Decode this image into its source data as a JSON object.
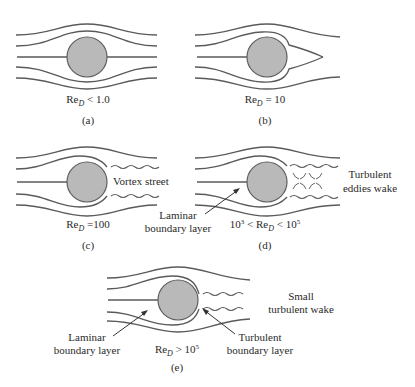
{
  "figure": {
    "panels": [
      {
        "id": "a",
        "caption": "(a)",
        "condition": {
          "prefix": "",
          "re": "Re",
          "sub": "D",
          "rel": " < 1.0",
          "suffix_sup": ""
        },
        "condition_text": "Re_D < 1.0",
        "flow": "symmetric laminar, no separation"
      },
      {
        "id": "b",
        "caption": "(b)",
        "condition": {
          "prefix": "",
          "re": "Re",
          "sub": "D",
          "rel": " = 10",
          "suffix_sup": ""
        },
        "condition_text": "Re_D = 10",
        "flow": "attached recirculation region behind cylinder"
      },
      {
        "id": "c",
        "caption": "(c)",
        "condition": {
          "prefix": "",
          "re": "Re",
          "sub": "D",
          "rel": " =100",
          "suffix_sup": ""
        },
        "condition_text": "Re_D = 100",
        "annotations": [
          "Vortex street"
        ]
      },
      {
        "id": "d",
        "caption": "(d)",
        "condition": {
          "prefix": "10",
          "prefix_sup": "3",
          "mid": " < ",
          "re": "Re",
          "sub": "D",
          "rel": " < 10",
          "suffix_sup": "5"
        },
        "condition_text": "10^3 < Re_D < 10^5",
        "annotations": [
          "Laminar boundary layer",
          "Turbulent eddies wake"
        ]
      },
      {
        "id": "e",
        "caption": "(e)",
        "condition": {
          "re": "Re",
          "sub": "D",
          "rel": " > 10",
          "suffix_sup": "5"
        },
        "condition_text": "Re_D > 10^5",
        "annotations": [
          "Laminar boundary layer",
          "Turbulent boundary layer",
          "Small turbulent wake"
        ]
      }
    ],
    "labels": {
      "vortex_street": "Vortex street",
      "laminar_line1": "Laminar",
      "laminar_line2": "boundary layer",
      "turb_eddies_line1": "Turbulent",
      "turb_eddies_line2": "eddies wake",
      "turb_bl_line1": "Turbulent",
      "turb_bl_line2": "boundary layer",
      "small_wake_line1": "Small",
      "small_wake_line2": "turbulent wake"
    },
    "colors": {
      "cylinder_fill": "#b9b9b9",
      "stroke": "#5a5a5a",
      "text": "#2a2a2a"
    }
  }
}
